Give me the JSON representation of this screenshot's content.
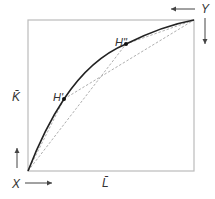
{
  "diagram": {
    "type": "edgeworth-box",
    "labels": {
      "origin_x": "X",
      "origin_y": "Y",
      "capital_axis": "K̄",
      "labor_axis": "L̄",
      "point_h1": "H'",
      "point_h2": "H\""
    },
    "box": {
      "left": 28,
      "top": 20,
      "right": 194,
      "bottom": 171
    },
    "points": {
      "X": [
        28,
        171
      ],
      "Y": [
        194,
        20
      ],
      "H1": [
        64,
        99
      ],
      "H2": [
        126,
        44
      ]
    },
    "colors": {
      "box": "#bbbbbb",
      "curve": "#222222",
      "dashed": "#999999",
      "arrows": "#444444",
      "text": "#333333"
    }
  }
}
